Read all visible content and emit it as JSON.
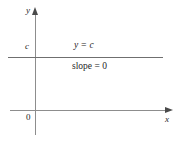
{
  "figure": {
    "kind": "coordinate-plane-diagram",
    "background_color": "#ffffff",
    "axis_color": "#8d8d8d",
    "line_color": "#6f6f6f",
    "text_color": "#262626"
  },
  "axes": {
    "y_axis_label": "y",
    "x_axis_label": "x",
    "origin_label": "0",
    "c_tick_label": "c"
  },
  "annotations": {
    "equation": "y = c",
    "slope": "slope = 0"
  },
  "chart_data": {
    "type": "line",
    "title": "",
    "xlabel": "x",
    "ylabel": "y",
    "grid": false,
    "legend": "none",
    "xlim": [
      -1,
      10
    ],
    "ylim": [
      -2,
      5
    ],
    "series": [
      {
        "name": "y = c",
        "x": [
          -1,
          10
        ],
        "values": [
          3,
          3
        ],
        "slope": 0,
        "intercept": "c"
      }
    ],
    "tick_labels": {
      "x": [
        "0"
      ],
      "y": [
        "c"
      ]
    },
    "annotations": [
      "y = c",
      "slope = 0"
    ]
  }
}
